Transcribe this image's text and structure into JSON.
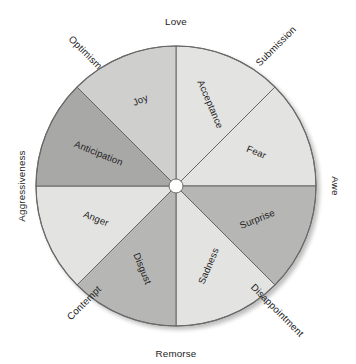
{
  "figure": {
    "name": "plutchik-emotion-wheel",
    "geometry": {
      "center_x": 176,
      "center_y": 186,
      "radius": 140,
      "hub_radius": 7,
      "sector_count": 8,
      "sector_span_degrees": 45
    },
    "colors": {
      "background": "#ffffff",
      "outline": "#5d5d5d",
      "rim": "#6a6a6a",
      "text": "#1d1d1d",
      "hub_fill": "#ffffff",
      "shade_lightest": "#e3e3e1",
      "shade_light": "#dcdcda",
      "shade_medium": "#cfcfcd",
      "shade_medium_dark": "#b6b6b4",
      "shade_dark": "#a8a8a6"
    }
  },
  "chart_data": {
    "type": "pie",
    "title": "",
    "subtitle": "",
    "xlabel": "",
    "ylabel": "",
    "legend_position": "none",
    "grid": false,
    "equal_slices": true,
    "slice_value": 12.5,
    "categories": [
      "Acceptance",
      "Fear",
      "Surprise",
      "Sadness",
      "Disgust",
      "Anger",
      "Anticipation",
      "Joy"
    ],
    "values": [
      12.5,
      12.5,
      12.5,
      12.5,
      12.5,
      12.5,
      12.5,
      12.5
    ],
    "slices": [
      {
        "label": "Acceptance",
        "start_deg": 0,
        "end_deg": 45,
        "mid_deg": 22.5,
        "color": "#e3e3e1",
        "label_rotation_deg": 67,
        "label_radius": 0.63
      },
      {
        "label": "Fear",
        "start_deg": 45,
        "end_deg": 90,
        "mid_deg": 67.5,
        "color": "#e3e3e1",
        "label_rotation_deg": 22,
        "label_radius": 0.62
      },
      {
        "label": "Surprise",
        "start_deg": 90,
        "end_deg": 135,
        "mid_deg": 112.5,
        "color": "#b6b6b4",
        "label_rotation_deg": -22,
        "label_radius": 0.63
      },
      {
        "label": "Sadness",
        "start_deg": 135,
        "end_deg": 180,
        "mid_deg": 157.5,
        "color": "#e3e3e1",
        "label_rotation_deg": -67,
        "label_radius": 0.62
      },
      {
        "label": "Disgust",
        "start_deg": 180,
        "end_deg": 225,
        "mid_deg": 202.5,
        "color": "#b6b6b4",
        "label_rotation_deg": -292,
        "label_radius": 0.64
      },
      {
        "label": "Anger",
        "start_deg": 225,
        "end_deg": 270,
        "mid_deg": 247.5,
        "color": "#e3e3e1",
        "label_rotation_deg": -338,
        "label_radius": 0.62
      },
      {
        "label": "Anticipation",
        "start_deg": 270,
        "end_deg": 315,
        "mid_deg": 292.5,
        "color": "#a8a8a6",
        "label_rotation_deg": 22,
        "label_radius": 0.6
      },
      {
        "label": "Joy",
        "start_deg": 315,
        "end_deg": 360,
        "mid_deg": 337.5,
        "color": "#cfcfcd",
        "label_rotation_deg": -23,
        "label_radius": 0.66
      }
    ],
    "outer_labels": [
      {
        "label": "Love",
        "boundary_deg": 0,
        "rotation_deg": 0,
        "anchor": "middle",
        "x": 176,
        "y": 22
      },
      {
        "label": "Submission",
        "boundary_deg": 45,
        "rotation_deg": -45,
        "anchor": "start",
        "x": 258,
        "y": 65
      },
      {
        "label": "Awe",
        "boundary_deg": 90,
        "rotation_deg": 90,
        "anchor": "middle",
        "x": 335,
        "y": 186
      },
      {
        "label": "Disappointment",
        "boundary_deg": 135,
        "rotation_deg": 45,
        "anchor": "start",
        "x": 252,
        "y": 286
      },
      {
        "label": "Remorse",
        "boundary_deg": 180,
        "rotation_deg": 0,
        "anchor": "middle",
        "x": 176,
        "y": 354
      },
      {
        "label": "Contempt",
        "boundary_deg": 225,
        "rotation_deg": -45,
        "anchor": "end",
        "x": 100,
        "y": 288
      },
      {
        "label": "Aggressiveness",
        "boundary_deg": 270,
        "rotation_deg": -90,
        "anchor": "middle",
        "x": 22,
        "y": 186
      },
      {
        "label": "Optimism",
        "boundary_deg": 315,
        "rotation_deg": 45,
        "anchor": "end",
        "x": 100,
        "y": 68
      }
    ]
  }
}
